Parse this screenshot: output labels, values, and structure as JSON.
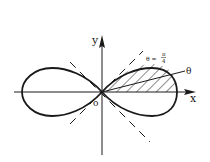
{
  "figure": {
    "axes": {
      "x_label": "x",
      "y_label": "y",
      "origin_label": "o"
    },
    "annotations": {
      "line_label_prefix": "θ =",
      "line_label_num": "π",
      "line_label_den": "4",
      "ray_label": "θ"
    },
    "colors": {
      "stroke": "#1a1a1a",
      "background": "#ffffff"
    }
  }
}
